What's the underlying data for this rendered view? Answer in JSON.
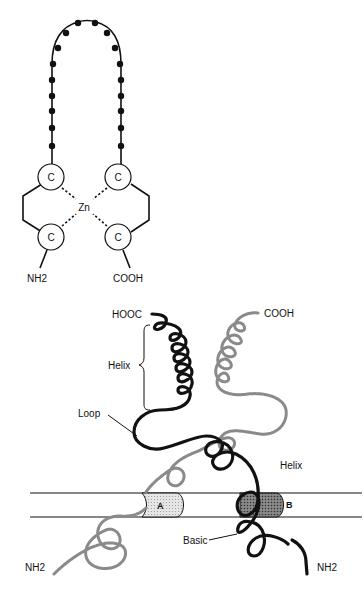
{
  "figure": {
    "top_panel": {
      "name": "zinc-finger",
      "cysteine_label": "C",
      "metal_label": "Zn",
      "n_terminus_label": "NH2",
      "c_terminus_label": "COOH",
      "cysteines": [
        {
          "position": "top-left",
          "label": "C"
        },
        {
          "position": "top-right",
          "label": "C"
        },
        {
          "position": "bottom-left",
          "label": "C"
        },
        {
          "position": "bottom-right",
          "label": "C"
        }
      ],
      "loop_residue_count": 18
    },
    "bottom_panel": {
      "name": "helix-loop-helix-dimer",
      "labels": {
        "hooc": "HOOC",
        "cooh": "COOH",
        "helix_upper": "Helix",
        "loop": "Loop",
        "helix_right": "Helix",
        "basic": "Basic",
        "nh2_left": "NH2",
        "nh2_right": "NH2",
        "site_a": "A",
        "site_b": "B"
      },
      "colors": {
        "monomer_1": "#111111",
        "monomer_2": "#8a8a8a",
        "site_a_fill": "#d9d9d9",
        "site_b_fill": "#7a7a7a"
      }
    }
  }
}
